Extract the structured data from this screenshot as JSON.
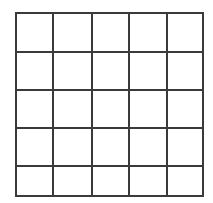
{
  "grid": {
    "rows": 5,
    "columns": 5,
    "line_color": "#3a3a3a",
    "background": "#ffffff",
    "x_lines": [
      16,
      53,
      92,
      129,
      167,
      203
    ],
    "y_lines": [
      13,
      52,
      90,
      128,
      166,
      196
    ]
  }
}
